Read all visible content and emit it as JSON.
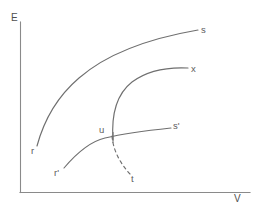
{
  "figure": {
    "type": "line-diagram",
    "background_color": "#ffffff",
    "line_color": "#6f6f6f",
    "axis_color": "#8a8a8a",
    "text_color": "#5d5d5d"
  },
  "axes": {
    "y_label": "E",
    "x_label": "V",
    "y_label_pos": {
      "x": 12,
      "y": 14
    },
    "x_label_pos": {
      "x": 234,
      "y": 194
    },
    "origin": {
      "x": 20,
      "y": 192
    },
    "y_top": {
      "x": 20,
      "y": 22
    },
    "x_right": {
      "x": 250,
      "y": 192
    },
    "ticks": false,
    "gridlines": false
  },
  "curves": [
    {
      "id": "curve-r-s",
      "start_label": "r",
      "end_label": "s",
      "style": "solid",
      "start_point": {
        "x": 37,
        "y": 146
      },
      "end_point": {
        "x": 198,
        "y": 30
      },
      "path": "M37,146 C44,120 58,96 79,78 C102,58 140,40 198,30"
    },
    {
      "id": "curve-u-x",
      "start_label": "u",
      "end_label": "x",
      "style": "solid",
      "start_point": {
        "x": 113,
        "y": 140
      },
      "end_point": {
        "x": 188,
        "y": 68
      },
      "path": "M113,140 C111,112 118,93 132,82 C148,70 168,67 188,68"
    },
    {
      "id": "curve-rprime-sprime",
      "start_label": "r'",
      "end_label": "s'",
      "style": "solid",
      "start_point": {
        "x": 64,
        "y": 168
      },
      "end_point": {
        "x": 171,
        "y": 128
      },
      "path": "M64,168 C75,155 88,142 105,138 C126,133 152,130 171,128"
    },
    {
      "id": "curve-u-t",
      "start_label": "u",
      "end_label": "t",
      "style": "dashed",
      "start_point": {
        "x": 112,
        "y": 136
      },
      "end_point": {
        "x": 130,
        "y": 174
      },
      "path": "M112,136 C113,149 119,162 130,174"
    }
  ],
  "points": [
    {
      "id": "point-u",
      "label": "u",
      "x": 113,
      "y": 137
    }
  ],
  "labels": [
    {
      "name": "label-s",
      "text": "s",
      "x": 201,
      "y": 25
    },
    {
      "name": "label-x",
      "text": "x",
      "x": 191,
      "y": 64
    },
    {
      "name": "label-s-prime",
      "text": "s'",
      "x": 173,
      "y": 121
    },
    {
      "name": "label-u",
      "text": "u",
      "x": 99,
      "y": 125
    },
    {
      "name": "label-r",
      "text": "r",
      "x": 31,
      "y": 146
    },
    {
      "name": "label-r-prime",
      "text": "r'",
      "x": 54,
      "y": 168
    },
    {
      "name": "label-t",
      "text": "t",
      "x": 131,
      "y": 174
    }
  ]
}
